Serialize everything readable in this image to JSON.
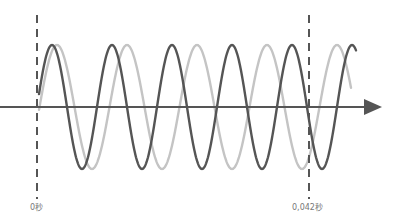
{
  "diagram": {
    "type": "wave-comparison",
    "colors": {
      "axis": "#555555",
      "wave_dark": "#555555",
      "wave_light": "#c4c4c4",
      "marker": "#555555",
      "label": "#777777"
    },
    "axis": {
      "y": 107,
      "x_start": 0,
      "x_end": 382,
      "arrow": true
    },
    "markers": [
      {
        "x": 37,
        "label": "0秒"
      },
      {
        "x": 309,
        "label": "0,042秒"
      }
    ],
    "waves": [
      {
        "name": "dark",
        "start_x": 39,
        "end_x": 356,
        "period_px": 60,
        "phase_peak_x": 52,
        "amplitude_px": 62
      },
      {
        "name": "light",
        "start_x": 39,
        "end_x": 351,
        "period_px": 70,
        "phase_peak_x": 57,
        "amplitude_px": 62
      }
    ]
  }
}
